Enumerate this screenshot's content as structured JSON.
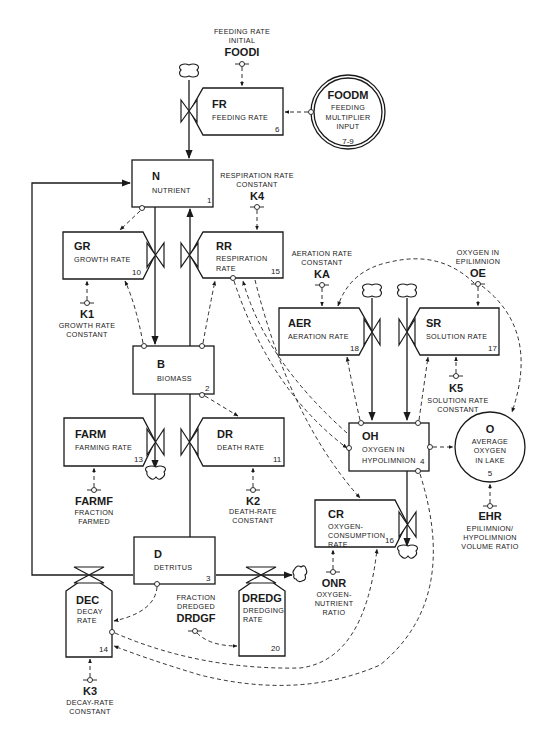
{
  "diagram": {
    "levels": [
      {
        "id": "N",
        "name": "NUTRIENT",
        "num": "1"
      },
      {
        "id": "B",
        "name": "BIOMASS",
        "num": "2"
      },
      {
        "id": "D",
        "name": "DETRITUS",
        "num": "3"
      },
      {
        "id": "OH",
        "name1": "OXYGEN IN",
        "name2": "HYPOLIMNION",
        "num": "4"
      }
    ],
    "rates": [
      {
        "id": "FR",
        "name": "FEEDING RATE",
        "num": "6"
      },
      {
        "id": "GR",
        "name": "GROWTH RATE",
        "num": "10"
      },
      {
        "id": "RR",
        "name1": "RESPIRATION",
        "name2": "RATE",
        "num": "15"
      },
      {
        "id": "FARM",
        "name": "FARMING RATE",
        "num": "13"
      },
      {
        "id": "DR",
        "name": "DEATH RATE",
        "num": "11"
      },
      {
        "id": "AER",
        "name": "AERATION RATE",
        "num": "18"
      },
      {
        "id": "SR",
        "name": "SOLUTION RATE",
        "num": "17"
      },
      {
        "id": "CR",
        "name1": "OXYGEN-",
        "name2": "CONSUMPTION",
        "name3": "RATE",
        "num": "16"
      },
      {
        "id": "DEC",
        "name1": "DECAY",
        "name2": "RATE",
        "num": "14"
      },
      {
        "id": "DREDG",
        "name1": "DREDGING",
        "name2": "RATE",
        "num": "20"
      }
    ],
    "auxiliaries": [
      {
        "id": "FOODM",
        "name1": "FEEDING",
        "name2": "MULTIPLIER",
        "name3": "INPUT",
        "num": "7-9"
      },
      {
        "id": "O",
        "name1": "AVERAGE",
        "name2": "OXYGEN",
        "name3": "IN LAKE",
        "num": "5"
      }
    ],
    "constants": [
      {
        "id": "FOODI",
        "label1": "FEEDING RATE",
        "label2": "INITIAL"
      },
      {
        "id": "K4",
        "label1": "RESPIRATION RATE",
        "label2": "CONSTANT"
      },
      {
        "id": "K1",
        "label1": "GROWTH RATE",
        "label2": "CONSTANT"
      },
      {
        "id": "KA",
        "label1": "AERATION RATE",
        "label2": "CONSTANT"
      },
      {
        "id": "OE",
        "label1": "OXYGEN IN",
        "label2": "EPILIMNION"
      },
      {
        "id": "K5",
        "label1": "SOLUTION RATE",
        "label2": "CONSTANT"
      },
      {
        "id": "FARMF",
        "label1": "FRACTION",
        "label2": "FARMED"
      },
      {
        "id": "K2",
        "label1": "DEATH-RATE",
        "label2": "CONSTANT"
      },
      {
        "id": "EHR",
        "label1": "EPILIMNION/",
        "label2": "HYPOLIMNION",
        "label3": "VOLUME RATIO"
      },
      {
        "id": "ONR",
        "label1": "OXYGEN-",
        "label2": "NUTRIENT",
        "label3": "RATIO"
      },
      {
        "id": "DRDGF",
        "label1": "FRACTION",
        "label2": "DREDGED"
      },
      {
        "id": "K3",
        "label1": "DECAY-RATE",
        "label2": "CONSTANT"
      }
    ]
  }
}
